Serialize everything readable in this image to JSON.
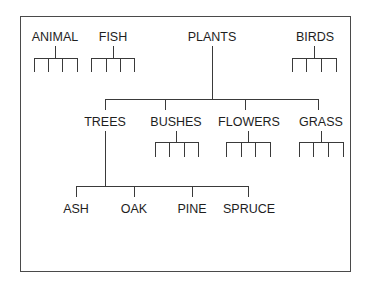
{
  "diagram": {
    "type": "hierarchy",
    "top_level": [
      {
        "label": "ANIMAL",
        "children_count_unlabeled": 4
      },
      {
        "label": "FISH",
        "children_count_unlabeled": 4
      },
      {
        "label": "PLANTS"
      },
      {
        "label": "BIRDS",
        "children_count_unlabeled": 4
      }
    ],
    "plants_children": [
      {
        "label": "TREES"
      },
      {
        "label": "BUSHES",
        "children_count_unlabeled": 4
      },
      {
        "label": "FLOWERS",
        "children_count_unlabeled": 4
      },
      {
        "label": "GRASS",
        "children_count_unlabeled": 4
      }
    ],
    "trees_children": [
      {
        "label": "ASH"
      },
      {
        "label": "OAK"
      },
      {
        "label": "PINE"
      },
      {
        "label": "SPRUCE"
      }
    ],
    "colors": {
      "line": "#3a3a3a",
      "text": "#1e1e1e",
      "background": "#ffffff"
    }
  }
}
